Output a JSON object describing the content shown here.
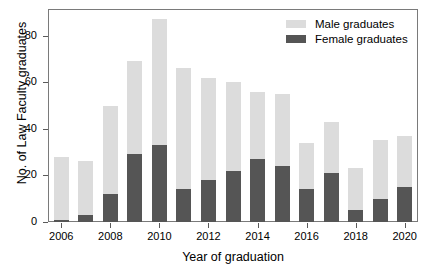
{
  "chart_data": {
    "type": "bar",
    "subtype": "stacked-bar",
    "title": "",
    "xlabel": "Year of graduation",
    "ylabel": "No. of Law Faculty graduates",
    "categories": [
      "2006",
      "2007",
      "2008",
      "2009",
      "2010",
      "2011",
      "2012",
      "2013",
      "2014",
      "2015",
      "2016",
      "2017",
      "2018",
      "2019",
      "2020"
    ],
    "xtick_labels": [
      "2006",
      "2008",
      "2010",
      "2012",
      "2014",
      "2016",
      "2018",
      "2020"
    ],
    "ytick_labels": [
      "0",
      "20",
      "40",
      "60",
      "80"
    ],
    "ytick_values": [
      0,
      20,
      40,
      60,
      80
    ],
    "ylim": [
      0,
      91
    ],
    "grid": false,
    "legend_position": "top-right",
    "series": [
      {
        "name": "Female graduates",
        "color": "#555555",
        "values": [
          1,
          3,
          12,
          29,
          33,
          14,
          18,
          22,
          27,
          24,
          14,
          21,
          5,
          10,
          15
        ]
      },
      {
        "name": "Male graduates",
        "color": "#dcdcdc",
        "values": [
          27,
          23,
          38,
          40,
          54,
          52,
          44,
          38,
          29,
          31,
          20,
          22,
          18,
          25,
          22
        ]
      }
    ],
    "totals": [
      28,
      26,
      50,
      69,
      87,
      66,
      62,
      60,
      56,
      55,
      34,
      43,
      23,
      35,
      37
    ]
  },
  "legend": {
    "items": [
      {
        "label": "Male graduates",
        "color": "#dcdcdc"
      },
      {
        "label": "Female graduates",
        "color": "#555555"
      }
    ]
  },
  "axes": {
    "x_title": "Year of graduation",
    "y_title": "No. of Law Faculty graduates"
  }
}
